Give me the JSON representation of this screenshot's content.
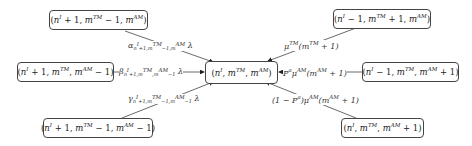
{
  "diagram": {
    "type": "state-transition",
    "center": {
      "label": "(n^I, m^TM, m^AM)"
    },
    "nodes": [
      {
        "id": "top-left",
        "label": "(n^I + 1, m^TM − 1, m^AM)"
      },
      {
        "id": "left",
        "label": "(n^I + 1, m^TM, m^AM − 1)"
      },
      {
        "id": "bottom-left",
        "label": "(n^I + 1, m^TM − 1, m^AM − 1)"
      },
      {
        "id": "top-right",
        "label": "(n^I − 1, m^TM + 1, m^AM)"
      },
      {
        "id": "right",
        "label": "(n^I − 1, m^TM, m^AM + 1)"
      },
      {
        "id": "bottom-right",
        "label": "(n^I, m^TM, m^AM + 1)"
      }
    ],
    "edges": [
      {
        "from": "top-left",
        "to": "center",
        "label": "α_{n^I+1, m^TM−1, m^AM} λ"
      },
      {
        "from": "left",
        "to": "center",
        "label": "β_{n^I+1, m^TM, m^AM−1} λ"
      },
      {
        "from": "bottom-left",
        "to": "center",
        "label": "γ_{n^I+1, m^TM−1, m^AM−1} λ"
      },
      {
        "from": "top-right",
        "to": "center",
        "label": "μ^TM (m^TM + 1)"
      },
      {
        "from": "right",
        "to": "center",
        "label": "P^a μ^AM (m^AM + 1)"
      },
      {
        "from": "bottom-right",
        "to": "center",
        "label": "(1 − P^a) μ^AM (m^AM + 1)"
      }
    ]
  }
}
